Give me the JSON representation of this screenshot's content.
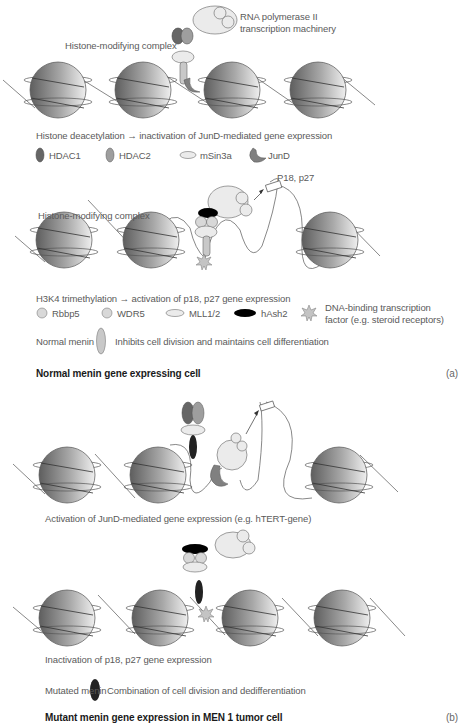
{
  "panel_a": {
    "rnapol_label_1": "RNA polymerase II",
    "rnapol_label_2": "transcription machinery",
    "hmc_label_top": "Histone-modifying complex",
    "caption_deacetylation": "Histone deacetylation → inactivation of JunD-mediated gene expression",
    "legend_1": [
      {
        "icon": "dark-ellipse-icon",
        "label": "HDAC1",
        "color": "#6a6a6a"
      },
      {
        "icon": "grey-ellipse-icon",
        "label": "HDAC2",
        "color": "#a0a0a0"
      },
      {
        "icon": "flat-ellipse-icon",
        "label": "mSin3a",
        "color": "#ececec"
      },
      {
        "icon": "crescent-icon",
        "label": "JunD",
        "color": "#808080"
      }
    ],
    "p18_label": "P18, p27",
    "hmc_label_mid": "Histone-modifying complex",
    "caption_trimethylation": "H3K4 trimethylation → activation of p18, p27 gene expression",
    "legend_2": [
      {
        "icon": "circle-icon",
        "label": "Rbbp5",
        "color": "#d8d8d8"
      },
      {
        "icon": "circle-icon",
        "label": "WDR5",
        "color": "#d8d8d8"
      },
      {
        "icon": "flat-ellipse-icon",
        "label": "MLL1/2",
        "color": "#ececec"
      },
      {
        "icon": "black-ellipse-icon",
        "label": "hAsh2",
        "color": "#000000"
      },
      {
        "icon": "star-icon",
        "label_1": "DNA-binding transcription",
        "label_2": "factor (e.g. steroid receptors)",
        "color": "#bdbdbd"
      }
    ],
    "normal_menin_label": "Normal menin",
    "normal_menin_desc": "Inhibits cell division and maintains cell differentiation",
    "title": "Normal menin gene expressing cell",
    "tag": "(a)"
  },
  "panel_b": {
    "caption_activation": "Activation of JunD-mediated gene expression (e.g. hTERT-gene)",
    "caption_inactivation": "Inactivation of p18, p27 gene expression",
    "mutated_menin_label": "Mutated menin",
    "mutated_menin_desc": "Combination of cell division and dedifferentiation",
    "title": "Mutant menin gene expression in MEN 1 tumor cell",
    "tag": "(b)"
  },
  "colors": {
    "hdac1": "#666666",
    "hdac2": "#9e9e9e",
    "light_protein": "#ebebeb",
    "menin_normal": "#c8c8c8",
    "menin_mutated": "#222222",
    "hash2": "#000000",
    "line": "#555555"
  }
}
